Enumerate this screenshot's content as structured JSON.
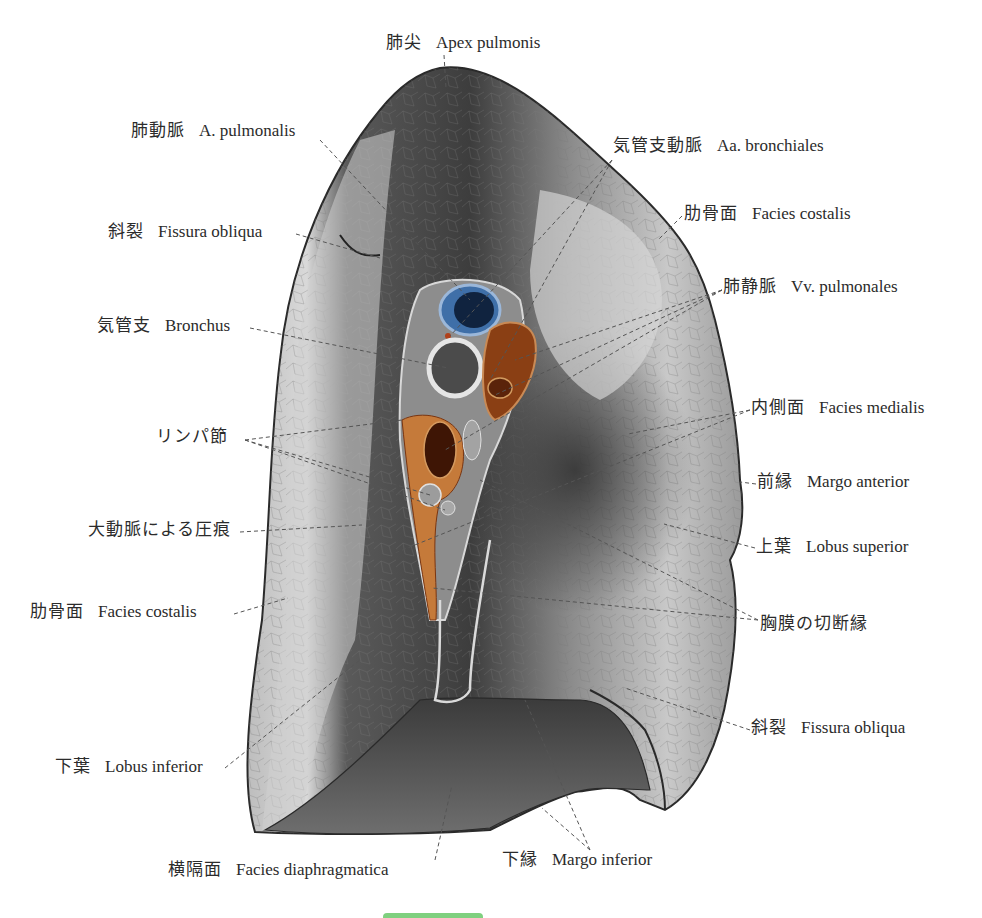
{
  "figure": {
    "colors": {
      "pulmonary_artery": "#3f6fa8",
      "pulmonary_vein": "#8a3f14",
      "lung_light": "#d8d8d8",
      "lung_dark": "#3a3a3a",
      "accent_bar": "#7fd07f"
    }
  },
  "labels": [
    {
      "id": "apex",
      "ja": "肺尖",
      "la": "Apex pulmonis"
    },
    {
      "id": "a-pulmonalis",
      "ja": "肺動脈",
      "la": "A. pulmonalis"
    },
    {
      "id": "aa-bronchiales",
      "ja": "気管支動脈",
      "la": "Aa. bronchiales"
    },
    {
      "id": "fissura-obliqua-upper",
      "ja": "斜裂",
      "la": "Fissura obliqua"
    },
    {
      "id": "facies-costalis-upper",
      "ja": "肋骨面",
      "la": "Facies costalis"
    },
    {
      "id": "vv-pulmonales",
      "ja": "肺静脈",
      "la": "Vv. pulmonales"
    },
    {
      "id": "bronchus",
      "ja": "気管支",
      "la": "Bronchus"
    },
    {
      "id": "lymph-nodes",
      "ja": "リンパ節",
      "la": ""
    },
    {
      "id": "facies-medialis",
      "ja": "内側面",
      "la": "Facies medialis"
    },
    {
      "id": "margo-anterior",
      "ja": "前縁",
      "la": "Margo anterior"
    },
    {
      "id": "aortic-impression",
      "ja": "大動脈による圧痕",
      "la": ""
    },
    {
      "id": "lobus-superior",
      "ja": "上葉",
      "la": "Lobus superior"
    },
    {
      "id": "facies-costalis-lower",
      "ja": "肋骨面",
      "la": "Facies costalis"
    },
    {
      "id": "pleura-cut-edge",
      "ja": "胸膜の切断縁",
      "la": ""
    },
    {
      "id": "fissura-obliqua-lower",
      "ja": "斜裂",
      "la": "Fissura obliqua"
    },
    {
      "id": "lobus-inferior",
      "ja": "下葉",
      "la": "Lobus inferior"
    },
    {
      "id": "facies-diaphragmatica",
      "ja": "横隔面",
      "la": "Facies diaphragmatica"
    },
    {
      "id": "margo-inferior",
      "ja": "下縁",
      "la": "Margo inferior"
    }
  ]
}
